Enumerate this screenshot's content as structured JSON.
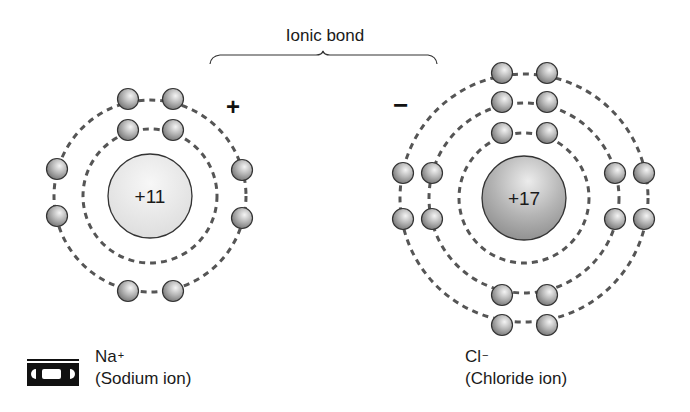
{
  "diagram": {
    "title": "Ionic bond",
    "sodium": {
      "nucleus_label": "+11",
      "charge_sign": "+",
      "symbol": "Na",
      "symbol_charge": "+",
      "name": "(Sodium ion)",
      "shells": [
        {
          "radius": 67,
          "electrons": 2
        },
        {
          "radius": 95,
          "electrons": 8
        }
      ]
    },
    "chloride": {
      "nucleus_label": "+17",
      "charge_sign": "−",
      "symbol": "Cl",
      "symbol_charge": "−",
      "name": "(Chloride ion)",
      "shells": [
        {
          "radius": 65,
          "electrons": 2
        },
        {
          "radius": 95,
          "electrons": 8
        },
        {
          "radius": 123,
          "electrons": 8
        }
      ]
    },
    "icons": {
      "media_icon": "video-cassette-icon"
    },
    "colors": {
      "ink": "#1a1a1a",
      "dash": "#555555",
      "na_nucleus": "#e8e8e8",
      "cl_nucleus": "#b0b0b0",
      "electron": "#9a9a9a"
    }
  }
}
